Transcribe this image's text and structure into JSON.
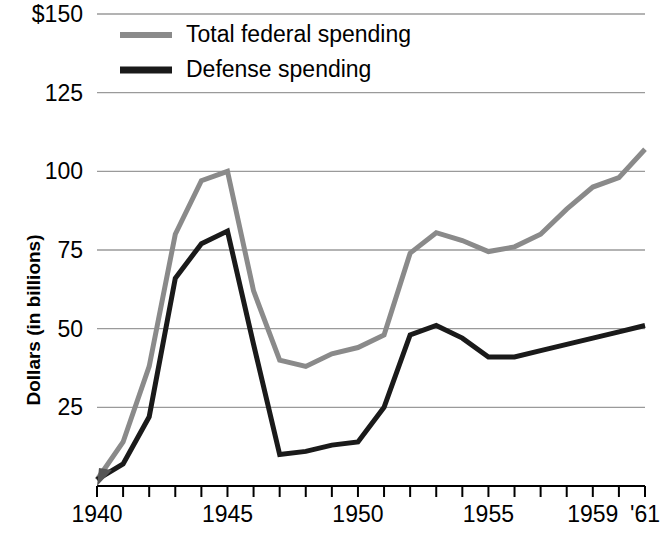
{
  "chart_data": {
    "type": "line",
    "title": "",
    "xlabel": "",
    "ylabel": "Dollars (in billions)",
    "xlim": [
      1940,
      1961
    ],
    "ylim": [
      0,
      150
    ],
    "grid": true,
    "legend_position": "top-left-inside",
    "y_ticks": [
      0,
      25,
      50,
      75,
      100,
      125,
      150
    ],
    "y_tick_labels": [
      "",
      "25",
      "50",
      "75",
      "100",
      "125",
      "$150"
    ],
    "x_ticks": [
      1940,
      1941,
      1942,
      1943,
      1944,
      1945,
      1946,
      1947,
      1948,
      1949,
      1950,
      1951,
      1952,
      1953,
      1954,
      1955,
      1956,
      1957,
      1958,
      1959,
      1960,
      1961
    ],
    "x_tick_labels": [
      "1940",
      "",
      "",
      "",
      "",
      "1945",
      "",
      "",
      "",
      "",
      "1950",
      "",
      "",
      "",
      "",
      "1955",
      "",
      "",
      "",
      "1959",
      "",
      "'61"
    ],
    "x": [
      1940,
      1941,
      1942,
      1943,
      1944,
      1945,
      1946,
      1947,
      1948,
      1949,
      1950,
      1951,
      1952,
      1953,
      1954,
      1955,
      1956,
      1957,
      1958,
      1959,
      1960,
      1961
    ],
    "series": [
      {
        "name": "Total federal spending",
        "color": "#8a8a8a",
        "line_width": 5,
        "values": [
          2,
          14,
          38,
          80,
          97,
          100,
          62,
          40,
          38,
          42,
          44,
          48,
          74,
          80.5,
          78,
          74.5,
          76,
          80,
          88,
          95,
          98,
          107
        ]
      },
      {
        "name": "Defense spending",
        "color": "#1a1a1a",
        "line_width": 5,
        "values": [
          2,
          7,
          22,
          66,
          77,
          81,
          45,
          10,
          11,
          13,
          14,
          25,
          48,
          51,
          47,
          41,
          41,
          43,
          45,
          47,
          49,
          51
        ]
      }
    ]
  },
  "legend": {
    "items": [
      {
        "label": "Total federal spending",
        "color": "#8a8a8a"
      },
      {
        "label": "Defense spending",
        "color": "#1a1a1a"
      }
    ]
  },
  "axes": {
    "y_axis_title": "Dollars (in billions)"
  }
}
